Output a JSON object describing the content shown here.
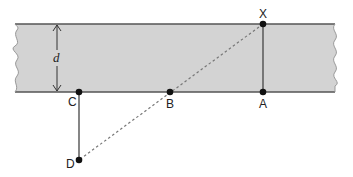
{
  "diagram": {
    "type": "geometry-river-width",
    "band": {
      "fill": "#d3d3d3",
      "edge_color": "#555555",
      "top_y": 24,
      "bottom_y": 92,
      "left_x": 15,
      "right_x": 335
    },
    "dimension": {
      "label": "d",
      "x": 57,
      "from_y": 24,
      "to_y": 92
    },
    "points": [
      {
        "id": "X",
        "label": "X",
        "x": 263,
        "y": 24,
        "label_dx": -4,
        "label_dy": -6
      },
      {
        "id": "A",
        "label": "A",
        "x": 263,
        "y": 92,
        "label_dx": -4,
        "label_dy": 16
      },
      {
        "id": "B",
        "label": "B",
        "x": 170,
        "y": 92,
        "label_dx": -4,
        "label_dy": 16
      },
      {
        "id": "C",
        "label": "C",
        "x": 79,
        "y": 92,
        "label_dx": -11,
        "label_dy": 14
      },
      {
        "id": "D",
        "label": "D",
        "x": 79,
        "y": 160,
        "label_dx": -13,
        "label_dy": 8
      }
    ],
    "solid_segments": [
      {
        "from": "X",
        "to": "A"
      },
      {
        "from": "C",
        "to": "D"
      }
    ],
    "dashed_segments": [
      {
        "from": "X",
        "to": "D",
        "via": "B"
      }
    ],
    "colors": {
      "line": "#444444",
      "dashed": "#777777",
      "point": "#111111",
      "label": "#222222"
    }
  }
}
